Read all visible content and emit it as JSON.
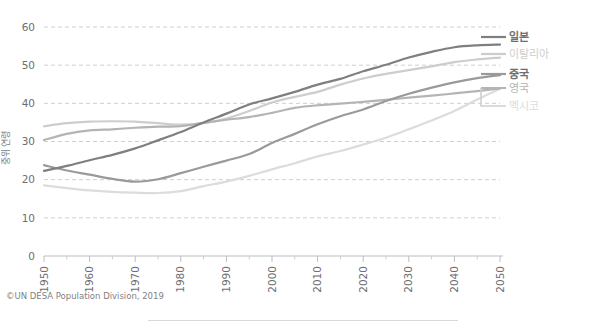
{
  "caption": "©UN DESA Population Division, 2019",
  "axes": {
    "ylabel": "중위 연령",
    "xlabel": "",
    "yticks": [
      0,
      10,
      20,
      30,
      40,
      50,
      60
    ],
    "xticks": [
      1950,
      1960,
      1970,
      1980,
      1990,
      2000,
      2010,
      2020,
      2030,
      2040,
      2050
    ],
    "xminor": [
      1955,
      1965,
      1975,
      1985,
      1995,
      2005,
      2015,
      2025,
      2035,
      2045
    ],
    "grid": "horizontal-dashed"
  },
  "legend": {
    "position": "right",
    "items": [
      {
        "label": "일본",
        "color": "#7f7f7f"
      },
      {
        "label": "이탈리아",
        "color": "#cdcdcd"
      },
      {
        "label": "중국",
        "color": "#9a9a9a"
      },
      {
        "label": "영국",
        "color": "#b4b4b4"
      },
      {
        "label": "멕시코",
        "color": "#dcdcdc"
      }
    ]
  },
  "chart_data": {
    "type": "line",
    "title": "",
    "subtitle": "",
    "xlabel": "",
    "ylabel": "중위 연령",
    "xlim": [
      1950,
      2050
    ],
    "ylim": [
      0,
      60
    ],
    "grid": true,
    "legend_position": "right",
    "x": [
      1950,
      1955,
      1960,
      1965,
      1970,
      1975,
      1980,
      1985,
      1990,
      1995,
      2000,
      2005,
      2010,
      2015,
      2020,
      2025,
      2030,
      2035,
      2040,
      2045,
      2050
    ],
    "series": [
      {
        "name": "일본",
        "color": "#7f7f7f",
        "values": [
          22.3,
          23.6,
          25.1,
          26.5,
          28.2,
          30.3,
          32.5,
          35.0,
          37.3,
          39.7,
          41.3,
          43.0,
          44.9,
          46.4,
          48.4,
          50.1,
          52.0,
          53.5,
          54.7,
          55.2,
          55.4
        ]
      },
      {
        "name": "이탈리아",
        "color": "#cdcdcd",
        "values": [
          34.0,
          34.8,
          35.2,
          35.3,
          35.2,
          34.8,
          34.4,
          34.8,
          36.0,
          38.0,
          40.2,
          41.7,
          43.0,
          44.9,
          46.5,
          47.7,
          48.7,
          49.7,
          50.8,
          51.5,
          52.0
        ]
      },
      {
        "name": "중국",
        "color": "#9a9a9a",
        "values": [
          23.8,
          22.4,
          21.3,
          20.2,
          19.5,
          20.1,
          21.7,
          23.4,
          25.0,
          26.7,
          29.6,
          32.0,
          34.5,
          36.6,
          38.4,
          40.6,
          42.5,
          44.1,
          45.5,
          46.6,
          47.4
        ]
      },
      {
        "name": "영국",
        "color": "#b4b4b4",
        "values": [
          30.4,
          32.0,
          32.9,
          33.2,
          33.6,
          33.9,
          34.0,
          34.9,
          35.7,
          36.4,
          37.5,
          38.8,
          39.5,
          39.9,
          40.4,
          40.9,
          41.5,
          42.0,
          42.6,
          43.2,
          43.9
        ]
      },
      {
        "name": "멕시코",
        "color": "#dcdcdc",
        "values": [
          18.5,
          17.8,
          17.2,
          16.8,
          16.6,
          16.5,
          17.0,
          18.3,
          19.5,
          21.0,
          22.7,
          24.3,
          26.1,
          27.5,
          29.2,
          31.0,
          33.2,
          35.5,
          38.0,
          41.0,
          43.8
        ]
      }
    ]
  }
}
